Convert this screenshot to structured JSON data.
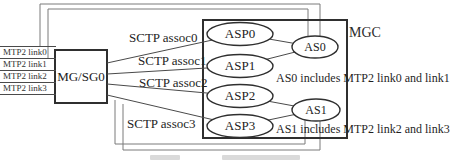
{
  "diagram": {
    "title_region": {
      "mgc_label": "MGC"
    },
    "gateway": {
      "label": "MG/SG0"
    },
    "mtp2_links": [
      "MTP2 link0",
      "MTP2 link1",
      "MTP2 link2",
      "MTP2 link3"
    ],
    "sctp_associations": [
      "SCTP assoc0",
      "SCTP assoc1",
      "SCTP assoc2",
      "SCTP assoc3"
    ],
    "asps": [
      "ASP0",
      "ASP1",
      "ASP2",
      "ASP3"
    ],
    "as_nodes": [
      "AS0",
      "AS1"
    ],
    "annotations": [
      "AS0 includes MTP2 link0 and link1",
      "AS1 includes MTP2 link2 and link3"
    ],
    "colors": {
      "background": "#ffffff",
      "box_border": "#2f2f2f",
      "ellipse_border": "#2f2f2f",
      "association_line": "#4a4a4a",
      "routing_line": "#7a7a7a",
      "text": "#222222"
    }
  }
}
